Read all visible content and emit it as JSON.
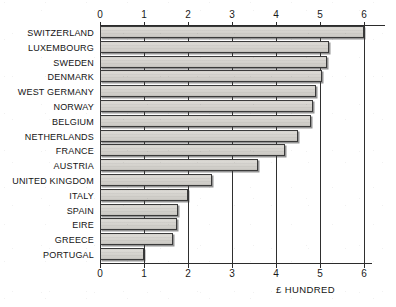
{
  "chart_data": {
    "type": "bar",
    "orientation": "horizontal",
    "title": "",
    "subtitle": "",
    "xlabel": "£ HUNDRED",
    "ylabel": "",
    "xlim": [
      0,
      6
    ],
    "ylim": null,
    "grid": true,
    "legend": null,
    "xticks": [
      "0",
      "1",
      "2",
      "3",
      "4",
      "5",
      "6"
    ],
    "xtick_values": [
      0,
      1,
      2,
      3,
      4,
      5,
      6
    ],
    "axis_top": true,
    "axis_bottom": true,
    "categories": [
      "SWITZERLAND",
      "LUXEMBOURG",
      "SWEDEN",
      "DENMARK",
      "WEST GERMANY",
      "NORWAY",
      "BELGIUM",
      "NETHERLANDS",
      "FRANCE",
      "AUSTRIA",
      "UNITED KINGDOM",
      "ITALY",
      "SPAIN",
      "EIRE",
      "GREECE",
      "PORTUGAL"
    ],
    "values": [
      6.0,
      5.2,
      5.15,
      5.05,
      4.9,
      4.85,
      4.8,
      4.5,
      4.2,
      3.6,
      2.55,
      2.0,
      1.78,
      1.75,
      1.65,
      1.0
    ],
    "units": "hundreds of pounds",
    "colors": {
      "bar_fill": "#d6d4cf",
      "bar_border": "#3a3a3a",
      "bar_shadow": "#3c3c3c",
      "axis": "#2b2b2b",
      "text": "#141414",
      "background": "#ffffff"
    }
  }
}
